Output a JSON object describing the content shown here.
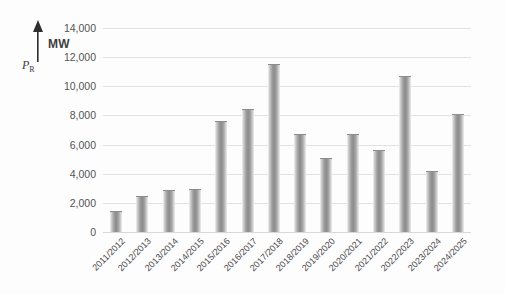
{
  "chart_data": {
    "type": "bar",
    "title": "",
    "subtitle": "",
    "xlabel": "",
    "ylabel": "P_R",
    "yunit": "MW",
    "ylim": [
      0,
      14000
    ],
    "ytick_step": 2000,
    "grid": true,
    "legend": "none",
    "yticks": [
      "0",
      "2,000",
      "4,000",
      "6,000",
      "8,000",
      "10,000",
      "12,000",
      "14,000"
    ],
    "ytick_values": [
      0,
      2000,
      4000,
      6000,
      8000,
      10000,
      12000,
      14000
    ],
    "categories": [
      "2011/2012",
      "2012/2013",
      "2013/2014",
      "2014/2015",
      "2015/2016",
      "2016/2017",
      "2017/2018",
      "2018/2019",
      "2019/2020",
      "2020/2021",
      "2021/2022",
      "2022/2023",
      "2023/2024",
      "2024/2025"
    ],
    "values": [
      1450,
      2500,
      2900,
      2950,
      7650,
      8450,
      11500,
      6700,
      5100,
      6700,
      5600,
      10700,
      4200,
      8100
    ],
    "series": [
      {
        "name": "P_R",
        "values": [
          1450,
          2500,
          2900,
          2950,
          7650,
          8450,
          11500,
          6700,
          5100,
          6700,
          5600,
          10700,
          4200,
          8100
        ]
      }
    ],
    "colors": {
      "bar_fill": "#9d9d9d",
      "bar_edge": "#8c8c8c",
      "gridline": "#e2e2e2",
      "text": "#4a4a4a",
      "background": "#fdfdfd"
    }
  },
  "axis": {
    "y_symbol": "P",
    "y_symbol_subscript": "R",
    "y_unit": "MW"
  }
}
